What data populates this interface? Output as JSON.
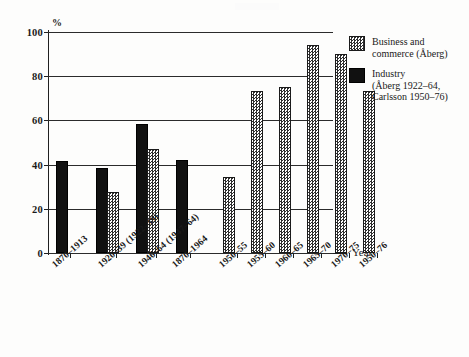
{
  "chart_data": {
    "type": "bar",
    "title": "",
    "xlabel": "Year",
    "ylabel": "%",
    "ylim": [
      0,
      100
    ],
    "yticks": [
      0,
      20,
      40,
      60,
      80,
      100
    ],
    "grid": true,
    "legend_position": "right",
    "categories": [
      "1870–1913",
      "1920–39 (1922–39)",
      "1946–64 (1947–64)",
      "1870–1964",
      "1950–55",
      "1955–60",
      "1960–65",
      "1965–70",
      "1970–75",
      "1950–76"
    ],
    "series": [
      {
        "name": "Industry (Åberg 1922–64, Carlsson 1950–76)",
        "key": "industry",
        "values": [
          41.5,
          38.5,
          58.5,
          42,
          null,
          null,
          null,
          null,
          null,
          null
        ]
      },
      {
        "name": "Business and commerce (Åberg)",
        "key": "business",
        "values": [
          null,
          27.5,
          47,
          null,
          34.5,
          73.5,
          75,
          94,
          90,
          73.5
        ]
      }
    ],
    "colors": {
      "industry": "#111111",
      "business": "#2e2e2e",
      "axis": "#202020",
      "background": "#fdfdfc"
    }
  },
  "axis": {
    "unit_label": "%",
    "x_title": "Year",
    "y_tick_labels": [
      "0",
      "20",
      "40",
      "60",
      "80",
      "100"
    ]
  },
  "legend": {
    "items": [
      {
        "swatch": "business",
        "label": "Business and\ncommerce (Åberg)"
      },
      {
        "swatch": "industry",
        "label": "Industry\n(Åberg 1922–64,\nCarlsson 1950–76)"
      }
    ]
  }
}
